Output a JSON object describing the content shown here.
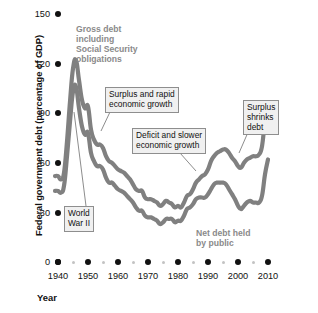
{
  "chart_data": {
    "type": "line",
    "title": "",
    "xlabel": "Year",
    "ylabel": "Federal government debt (percentage of GDP)",
    "xlim": [
      1938,
      2011
    ],
    "ylim": [
      0,
      150
    ],
    "yticks": [
      0,
      30,
      60,
      90,
      120,
      150
    ],
    "xticks": [
      1940,
      1950,
      1960,
      1970,
      1980,
      1990,
      2000,
      2010
    ],
    "xticks_minor": [
      1945,
      1955,
      1965,
      1975,
      1985,
      1995,
      2005
    ],
    "grid": false,
    "legend": "inline-labels",
    "series": [
      {
        "name": "Gross debt including Social Security obligations",
        "color": "#808080",
        "x": [
          1939,
          1940,
          1941,
          1942,
          1943,
          1944,
          1945,
          1946,
          1947,
          1948,
          1949,
          1950,
          1951,
          1952,
          1953,
          1954,
          1955,
          1956,
          1957,
          1958,
          1959,
          1960,
          1961,
          1962,
          1963,
          1964,
          1965,
          1966,
          1967,
          1968,
          1969,
          1970,
          1971,
          1972,
          1973,
          1974,
          1975,
          1976,
          1977,
          1978,
          1979,
          1980,
          1981,
          1982,
          1983,
          1984,
          1985,
          1986,
          1987,
          1988,
          1989,
          1990,
          1991,
          1992,
          1993,
          1994,
          1995,
          1996,
          1997,
          1998,
          1999,
          2000,
          2001,
          2002,
          2003,
          2004,
          2005,
          2006,
          2007,
          2008,
          2009,
          2010
        ],
        "y": [
          52,
          52,
          50,
          54,
          73,
          97,
          117,
          122,
          110,
          98,
          93,
          94,
          80,
          74,
          71,
          71,
          69,
          64,
          61,
          60,
          58,
          56,
          55,
          54,
          52,
          50,
          47,
          44,
          43,
          43,
          39,
          38,
          38,
          37,
          36,
          34,
          35,
          37,
          36,
          35,
          33,
          34,
          33,
          36,
          40,
          41,
          44,
          48,
          50,
          52,
          53,
          56,
          61,
          64,
          66,
          67,
          68,
          68,
          66,
          63,
          61,
          58,
          57,
          60,
          62,
          63,
          64,
          64,
          65,
          70,
          85,
          93
        ]
      },
      {
        "name": "Net debt held by public",
        "color": "#808080",
        "x": [
          1939,
          1940,
          1941,
          1942,
          1943,
          1944,
          1945,
          1946,
          1947,
          1948,
          1949,
          1950,
          1951,
          1952,
          1953,
          1954,
          1955,
          1956,
          1957,
          1958,
          1959,
          1960,
          1961,
          1962,
          1963,
          1964,
          1965,
          1966,
          1967,
          1968,
          1969,
          1970,
          1971,
          1972,
          1973,
          1974,
          1975,
          1976,
          1977,
          1978,
          1979,
          1980,
          1981,
          1982,
          1983,
          1984,
          1985,
          1986,
          1987,
          1988,
          1989,
          1990,
          1991,
          1992,
          1993,
          1994,
          1995,
          1996,
          1997,
          1998,
          1999,
          2000,
          2001,
          2002,
          2003,
          2004,
          2005,
          2006,
          2007,
          2008,
          2009,
          2010
        ],
        "y": [
          43,
          43,
          42,
          46,
          64,
          85,
          103,
          106,
          93,
          82,
          77,
          78,
          66,
          61,
          58,
          58,
          56,
          51,
          48,
          48,
          46,
          44,
          43,
          42,
          40,
          38,
          36,
          33,
          31,
          31,
          28,
          27,
          27,
          26,
          25,
          23,
          24,
          26,
          26,
          26,
          24,
          25,
          25,
          28,
          32,
          33,
          35,
          38,
          39,
          39,
          39,
          41,
          44,
          47,
          48,
          48,
          48,
          47,
          44,
          41,
          38,
          34,
          32,
          34,
          36,
          37,
          36,
          36,
          36,
          40,
          53,
          62
        ]
      }
    ],
    "annotations": [
      {
        "id": "gross-debt-note",
        "text": "Gross debt\nincluding\nSocial Security\nobligations",
        "style": "plain-gray",
        "boxed": false
      },
      {
        "id": "surplus-rapid-growth",
        "text": "Surplus and rapid\neconomic growth",
        "style": "boxed",
        "boxed": true
      },
      {
        "id": "deficit-slower-growth",
        "text": "Deficit and slower\neconomic growth",
        "style": "boxed",
        "boxed": true
      },
      {
        "id": "surplus-shrinks-debt",
        "text": "Surplus\nshrinks\ndebt",
        "style": "boxed",
        "boxed": true
      },
      {
        "id": "world-war-two",
        "text": "World\nWar II",
        "style": "boxed",
        "boxed": true
      },
      {
        "id": "net-debt-note",
        "text": "Net debt held\nby public",
        "style": "plain-gray",
        "boxed": false
      }
    ]
  },
  "axes": {
    "y_title": "Federal government debt (percentage of GDP)",
    "x_title": "Year",
    "y_tick_labels": [
      "150",
      "120",
      "90",
      "60",
      "30",
      "0"
    ],
    "x_tick_labels": [
      "1940",
      "1950",
      "1960",
      "1970",
      "1980",
      "1990",
      "2000",
      "2010"
    ]
  },
  "colors": {
    "curve": "#808080",
    "note_text": "#8a8a8a",
    "callout_fill": "#f0f0f0",
    "callout_border": "#8e8e8e",
    "tick_major": "#111111",
    "tick_minor": "#c3c3c3"
  }
}
